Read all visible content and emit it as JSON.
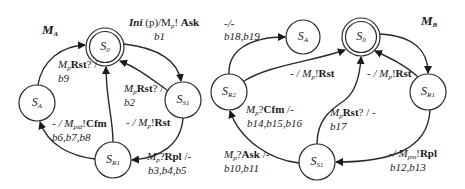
{
  "machines": [
    {
      "id": "MA",
      "title": {
        "main": "M",
        "sub": "A"
      },
      "states": [
        {
          "id": "S0",
          "main": "S",
          "sub": "0",
          "initial": true
        },
        {
          "id": "SA",
          "main": "S",
          "sub": "A"
        },
        {
          "id": "SS1",
          "main": "S",
          "sub": "S1"
        },
        {
          "id": "SR1",
          "main": "S",
          "sub": "R1"
        }
      ],
      "transitions": [
        {
          "from": "S0",
          "to": "SS1",
          "line1": {
            "pre": "Ini",
            "mid": " (p)/M",
            "sub": "p",
            "post": "! ",
            "bold": "Ask"
          },
          "line2": "b1"
        },
        {
          "from": "SA",
          "to": "S0",
          "line1": {
            "pre": "M",
            "sub": "p",
            "bold": "Rst",
            "post": "? /"
          },
          "line2": "b9"
        },
        {
          "from": "SS1",
          "to": "S0",
          "line1": {
            "pre": "M",
            "sub": "p",
            "bold": "Rst",
            "post": "? /"
          },
          "line2": "b2"
        },
        {
          "from": "SR1",
          "to": "S0",
          "line1": {
            "pre": "- / M",
            "sub": "p",
            "post": "!",
            "bold": "Rst"
          },
          "line2": ""
        },
        {
          "from": "SR1",
          "to": "SA",
          "line1": {
            "pre": "- / M",
            "sub": "pid",
            "post": "!",
            "bold": "Cfm"
          },
          "line2": "b6,b7,b8"
        },
        {
          "from": "SS1",
          "to": "SR1",
          "line1": {
            "pre": "M",
            "sub": "p",
            "mid": "?",
            "bold": "Rpl",
            "post": " /-"
          },
          "line2": "b3,b4,b5"
        }
      ]
    },
    {
      "id": "MB",
      "title": {
        "main": "M",
        "sub": "B"
      },
      "states": [
        {
          "id": "S0",
          "main": "S",
          "sub": "0",
          "initial": true
        },
        {
          "id": "SA",
          "main": "S",
          "sub": "A"
        },
        {
          "id": "SR2",
          "main": "S",
          "sub": "R2"
        },
        {
          "id": "SR1",
          "main": "S",
          "sub": "R1"
        },
        {
          "id": "SS1",
          "main": "S",
          "sub": "S1"
        }
      ],
      "transitions": [
        {
          "from": "SR2",
          "to": "SA",
          "line1": "-/-",
          "line2": "b18,b19"
        },
        {
          "from": "SR2",
          "to": "S0",
          "line1": {
            "pre": "- / M",
            "sub": "p",
            "post": "!",
            "bold": "Rst"
          },
          "line2": ""
        },
        {
          "from": "SR1",
          "to": "S0",
          "line1": {
            "pre": "- / M",
            "sub": "p",
            "post": "!",
            "bold": "Rst"
          },
          "line2": ""
        },
        {
          "from": "S0",
          "to": "SR1",
          "line1": "",
          "line2": ""
        },
        {
          "from": "SS1",
          "to": "SR2",
          "line1": {
            "pre": "M",
            "sub": "p",
            "mid": "?",
            "bold": "Cfm",
            "post": " /-"
          },
          "line2": "b14,b15,b16"
        },
        {
          "from": "SS1",
          "to": "S0",
          "line1": {
            "pre": "M",
            "sub": "p",
            "bold": "Rst",
            "post": "? / -"
          },
          "line2": "b17"
        },
        {
          "from": "SS1",
          "to": "SR2",
          "line1": {
            "pre": "M",
            "sub": "p",
            "mid": "?",
            "bold": "Ask",
            "post": " /-"
          },
          "line2": "b10,b11"
        },
        {
          "from": "SR1",
          "to": "SS1",
          "line1": {
            "pre": "-/ M",
            "sub": "pm",
            "post": "!",
            "bold": "Rpl"
          },
          "line2": "b12,b13"
        }
      ]
    }
  ]
}
